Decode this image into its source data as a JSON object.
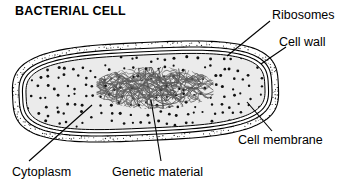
{
  "figure": {
    "title": "BACTERIAL CELL",
    "background_color": "#ffffff",
    "ink_color": "#000000"
  },
  "labels": {
    "ribosomes": "Ribosomes",
    "cell_wall": "Cell wall",
    "cell_membrane": "Cell membrane",
    "cytoplasm": "Cytoplasm",
    "genetic_material": "Genetic material"
  },
  "diagram": {
    "type": "labeled-biological-diagram",
    "structures": [
      {
        "name": "cell wall",
        "description": "outer stippled band forming the rod-shaped capsule outline",
        "fill": "#ffffff",
        "texture": "fine stipple",
        "stroke": "#000000"
      },
      {
        "name": "cell membrane",
        "description": "thin line just inside the cell wall, separated by a white gap",
        "fill": "#ffffff",
        "stroke": "#000000"
      },
      {
        "name": "cytoplasm",
        "description": "light gray interior filled with scattered dark dots",
        "fill": "#ebebeb",
        "stroke": "#000000"
      },
      {
        "name": "ribosomes",
        "description": "small dark dots scattered throughout the cytoplasm",
        "fill": "#1a1a1a"
      },
      {
        "name": "genetic material",
        "description": "dense tangle of looping threads (nucleoid) at the cell center",
        "stroke": "#555555"
      }
    ],
    "leader_lines": [
      {
        "label": "ribosomes",
        "from_x": 270,
        "from_y": 21,
        "to_x": 227,
        "to_y": 56
      },
      {
        "label": "cell_wall",
        "from_x": 286,
        "from_y": 47,
        "to_x": 261,
        "to_y": 64
      },
      {
        "label": "cell_membrane",
        "from_x": 272,
        "from_y": 131,
        "to_x": 247,
        "to_y": 102
      },
      {
        "label": "cytoplasm",
        "from_x": 29,
        "from_y": 161,
        "to_x": 92,
        "to_y": 105
      },
      {
        "label": "genetic_material",
        "from_x": 161,
        "from_y": 161,
        "to_x": 151,
        "to_y": 100
      }
    ]
  }
}
